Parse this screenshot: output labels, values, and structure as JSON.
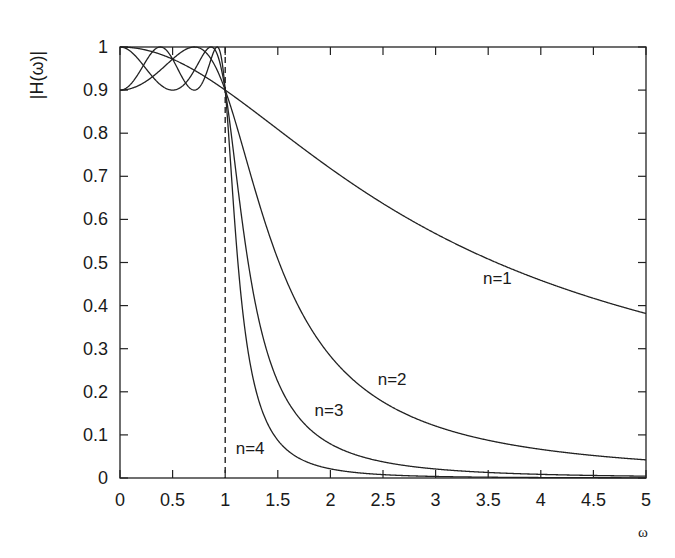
{
  "chart_data": {
    "type": "line",
    "title": "",
    "xlabel": "ω",
    "ylabel": "|H(ω)|",
    "xlim": [
      0,
      5
    ],
    "ylim": [
      0,
      1
    ],
    "grid": false,
    "legend_position": "none (inline curve labels)",
    "x_ticks": [
      "0",
      "0.5",
      "1",
      "1.5",
      "2",
      "2.5",
      "3",
      "3.5",
      "4",
      "4.5",
      "5"
    ],
    "y_ticks": [
      "0",
      "0.1",
      "0.2",
      "0.3",
      "0.4",
      "0.5",
      "0.6",
      "0.7",
      "0.8",
      "0.9",
      "1"
    ],
    "epsilon": 0.4843,
    "ripple_min": 0.9,
    "cutoff_marker": {
      "x": 1,
      "style": "dashed vertical line"
    },
    "x": [
      0,
      0.25,
      0.5,
      0.707,
      0.75,
      0.866,
      0.924,
      1,
      1.25,
      1.5,
      2,
      2.5,
      3,
      3.5,
      4,
      4.5,
      5
    ],
    "series": [
      {
        "name": "n=1",
        "values": [
          1.0,
          0.993,
          0.972,
          0.945,
          0.938,
          0.918,
          0.908,
          0.9,
          0.867,
          0.803,
          0.718,
          0.637,
          0.567,
          0.508,
          0.459,
          0.418,
          0.382
        ]
      },
      {
        "name": "n=2",
        "values": [
          0.9,
          0.963,
          0.999,
          1.0,
          0.998,
          0.97,
          0.948,
          0.9,
          0.676,
          0.488,
          0.27,
          0.171,
          0.118,
          0.087,
          0.066,
          0.052,
          0.042
        ]
      },
      {
        "name": "n=3",
        "values": [
          1.0,
          0.952,
          0.9,
          0.968,
          0.98,
          1.0,
          0.988,
          0.9,
          0.46,
          0.249,
          0.078,
          0.034,
          0.017,
          0.01,
          0.006,
          0.004,
          0.003
        ]
      },
      {
        "name": "n=4",
        "values": [
          0.9,
          0.966,
          0.998,
          0.9,
          0.918,
          1.0,
          1.0,
          0.9,
          0.327,
          0.127,
          0.023,
          0.007,
          0.003,
          0.001,
          0.001,
          0.0,
          0.0
        ]
      }
    ],
    "annotations": [
      {
        "text": "n=1",
        "x": 3.45,
        "y": 0.45
      },
      {
        "text": "n=2",
        "x": 2.45,
        "y": 0.215
      },
      {
        "text": "n=3",
        "x": 1.85,
        "y": 0.145
      },
      {
        "text": "n=4",
        "x": 1.1,
        "y": 0.055
      }
    ]
  }
}
